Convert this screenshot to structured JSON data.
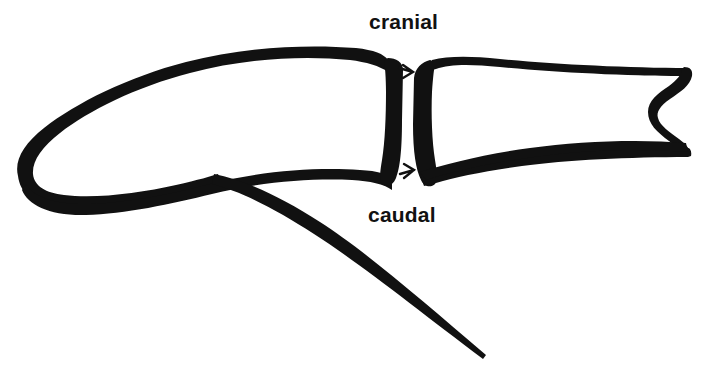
{
  "figure": {
    "type": "anatomical-line-drawing",
    "background_color": "#ffffff",
    "ink_color": "#111111",
    "width": 704,
    "height": 380
  },
  "labels": {
    "cranial": "cranial",
    "caudal": "caudal"
  },
  "parts": {
    "proximal_segment_name": "proximal-bone-segment",
    "distal_segment_name": "distal-bone-segment",
    "joint_name": "joint-space",
    "tail_name": "caudal-process",
    "notch_name": "distal-notch",
    "tick_top_name": "joint-marker-top",
    "tick_bottom_name": "joint-marker-bottom"
  }
}
